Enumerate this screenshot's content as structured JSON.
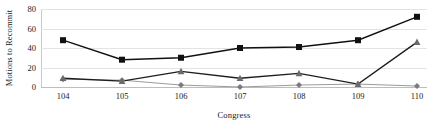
{
  "chart_data": {
    "type": "line",
    "title": "",
    "xlabel": "Congress",
    "ylabel": "Motions to Recommit",
    "categories": [
      "104",
      "105",
      "106",
      "107",
      "108",
      "109",
      "110"
    ],
    "ylim": [
      0,
      80
    ],
    "yticks": [
      0,
      20,
      40,
      60,
      80
    ],
    "grid": true,
    "legend": "none",
    "series": [
      {
        "name": "series-squares",
        "marker": "square",
        "color": "#111111",
        "line_color": "#111111",
        "values": [
          48,
          28,
          30,
          40,
          41,
          48,
          72
        ]
      },
      {
        "name": "series-triangles",
        "marker": "triangle",
        "color": "#6b6b6b",
        "line_color": "#1d1d1d",
        "values": [
          9,
          6,
          16,
          9,
          14,
          3,
          46
        ]
      },
      {
        "name": "series-diamonds",
        "marker": "diamond",
        "color": "#7a7a7a",
        "line_color": "#9b9b9b",
        "values": [
          8,
          7,
          2,
          0,
          2,
          3,
          1
        ]
      }
    ]
  }
}
